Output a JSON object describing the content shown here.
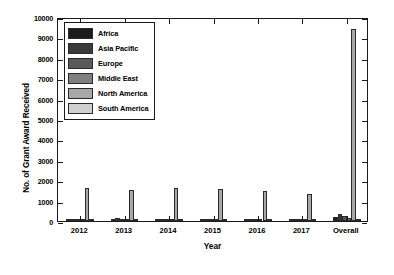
{
  "chart_data": {
    "type": "bar",
    "title": "",
    "xlabel": "Year",
    "ylabel": "No. of Grant Award Received",
    "categories": [
      "2012",
      "2013",
      "2014",
      "2015",
      "2016",
      "2017",
      "Overall"
    ],
    "ylim": [
      0,
      10000
    ],
    "yticks": [
      0,
      1000,
      2000,
      3000,
      4000,
      5000,
      6000,
      7000,
      8000,
      9000,
      10000
    ],
    "ytick_labels": [
      "0",
      "1000",
      "2000",
      "3000",
      "4000",
      "5000",
      "6000",
      "7000",
      "8000",
      "9000",
      "10000"
    ],
    "grid": false,
    "legend_position": "upper-left-inside",
    "series": [
      {
        "name": "Africa",
        "color": "#1c1c1c",
        "values": [
          35,
          40,
          30,
          35,
          30,
          30,
          200
        ]
      },
      {
        "name": "Asia Pacific",
        "color": "#3a3a3a",
        "values": [
          110,
          125,
          120,
          115,
          95,
          80,
          350
        ]
      },
      {
        "name": "Europe",
        "color": "#595959",
        "values": [
          60,
          70,
          65,
          60,
          55,
          50,
          250
        ]
      },
      {
        "name": "Middle East",
        "color": "#808080",
        "values": [
          25,
          30,
          30,
          25,
          25,
          20,
          150
        ]
      },
      {
        "name": "North America",
        "color": "#a8a8a8",
        "values": [
          1600,
          1520,
          1600,
          1560,
          1480,
          1330,
          9400
        ]
      },
      {
        "name": "South America",
        "color": "#cfcfcf",
        "values": [
          15,
          20,
          15,
          15,
          15,
          15,
          100
        ]
      }
    ]
  },
  "legend": {
    "items": [
      {
        "label": "Africa"
      },
      {
        "label": "Asia Pacific"
      },
      {
        "label": "Europe"
      },
      {
        "label": "Middle East"
      },
      {
        "label": "North America"
      },
      {
        "label": "South America"
      }
    ]
  }
}
